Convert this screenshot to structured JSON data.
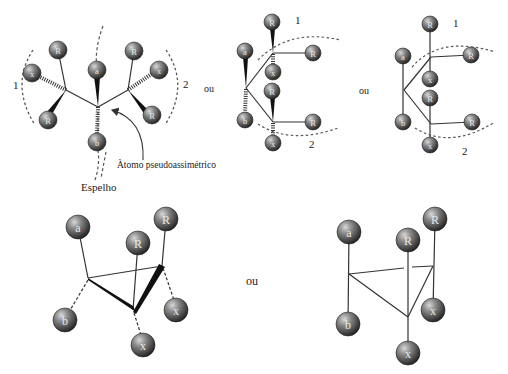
{
  "figure": {
    "labels": {
      "mirror": "Espelho",
      "pseudo_atom": "Àtomo pseudoassimétrico",
      "ou": "ou",
      "group1": "1",
      "group2": "2"
    },
    "colors": {
      "bond": "#333333",
      "sphere_light": "#bdbdbd",
      "sphere_dark": "#2a2a2a",
      "dash": "#555555"
    }
  },
  "structures": [
    {
      "id": "sawhorse",
      "atoms": [
        {
          "label": "R",
          "x": 58,
          "y": 50,
          "r": 9
        },
        {
          "label": "x",
          "x": 32,
          "y": 73,
          "r": 9
        },
        {
          "label": "R",
          "x": 48,
          "y": 120,
          "r": 9
        },
        {
          "label": "a",
          "x": 97,
          "y": 70,
          "r": 9
        },
        {
          "label": "b",
          "x": 97,
          "y": 142,
          "r": 9
        },
        {
          "label": "R",
          "x": 134,
          "y": 51,
          "r": 9
        },
        {
          "label": "x",
          "x": 159,
          "y": 70,
          "r": 9
        },
        {
          "label": "R",
          "x": 152,
          "y": 115,
          "r": 9
        }
      ]
    },
    {
      "id": "fischer-wedge",
      "atoms": [
        {
          "label": "R",
          "x": 272,
          "y": 22,
          "r": 8
        },
        {
          "label": "a",
          "x": 245,
          "y": 51,
          "r": 8
        },
        {
          "label": "R",
          "x": 313,
          "y": 53,
          "r": 8
        },
        {
          "label": "x",
          "x": 273,
          "y": 72,
          "r": 8
        },
        {
          "label": "R",
          "x": 272,
          "y": 91,
          "r": 8
        },
        {
          "label": "b",
          "x": 245,
          "y": 120,
          "r": 8
        },
        {
          "label": "R",
          "x": 313,
          "y": 122,
          "r": 8
        },
        {
          "label": "x",
          "x": 273,
          "y": 143,
          "r": 8
        }
      ]
    },
    {
      "id": "fischer-plain",
      "atoms": [
        {
          "label": "R",
          "x": 430,
          "y": 24,
          "r": 8
        },
        {
          "label": "a",
          "x": 403,
          "y": 56,
          "r": 8
        },
        {
          "label": "R",
          "x": 471,
          "y": 55,
          "r": 8
        },
        {
          "label": "x",
          "x": 430,
          "y": 79,
          "r": 8
        },
        {
          "label": "R",
          "x": 430,
          "y": 98,
          "r": 8
        },
        {
          "label": "b",
          "x": 403,
          "y": 122,
          "r": 8
        },
        {
          "label": "R",
          "x": 472,
          "y": 122,
          "r": 8
        },
        {
          "label": "x",
          "x": 430,
          "y": 145,
          "r": 8
        }
      ]
    },
    {
      "id": "cyclopropane-perspective",
      "atoms": [
        {
          "label": "a",
          "x": 78,
          "y": 227,
          "r": 12
        },
        {
          "label": "R",
          "x": 138,
          "y": 243,
          "r": 12
        },
        {
          "label": "R",
          "x": 166,
          "y": 219,
          "r": 12
        },
        {
          "label": "b",
          "x": 65,
          "y": 320,
          "r": 12
        },
        {
          "label": "x",
          "x": 176,
          "y": 310,
          "r": 12
        },
        {
          "label": "x",
          "x": 143,
          "y": 345,
          "r": 12
        }
      ]
    },
    {
      "id": "cyclopropane-plain",
      "atoms": [
        {
          "label": "a",
          "x": 349,
          "y": 232,
          "r": 12
        },
        {
          "label": "R",
          "x": 408,
          "y": 240,
          "r": 12
        },
        {
          "label": "R",
          "x": 435,
          "y": 219,
          "r": 12
        },
        {
          "label": "b",
          "x": 348,
          "y": 324,
          "r": 12
        },
        {
          "label": "x",
          "x": 433,
          "y": 310,
          "r": 12
        },
        {
          "label": "x",
          "x": 408,
          "y": 353,
          "r": 12
        }
      ]
    }
  ]
}
